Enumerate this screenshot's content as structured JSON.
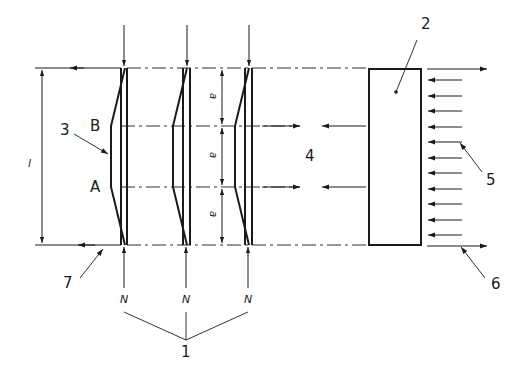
{
  "diagram": {
    "type": "technical-schematic",
    "colors": {
      "line": "#1a1a1a",
      "background": "#ffffff"
    },
    "callouts": {
      "c1": "1",
      "c2": "2",
      "c3": "3",
      "c4": "4",
      "c5": "5",
      "c6": "6",
      "c7": "7"
    },
    "points": {
      "B": "B",
      "A": "A"
    },
    "dimensions": {
      "length": "l",
      "segment_top": "a",
      "segment_mid": "a",
      "segment_bot": "a"
    },
    "loads": {
      "n1": "N",
      "n2": "N",
      "n3": "N"
    }
  }
}
